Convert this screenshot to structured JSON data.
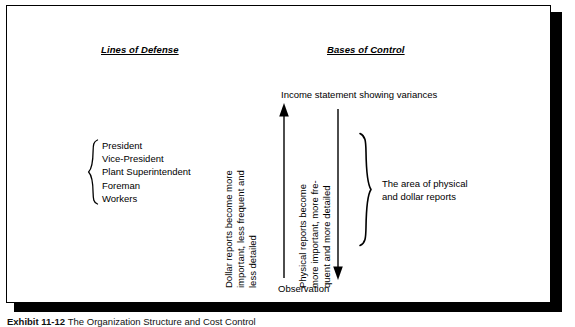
{
  "exhibit": {
    "caption_label": "Exhibit 11-12",
    "caption_title": "The Organization Structure and Cost Control"
  },
  "headings": {
    "left": "Lines of Defense",
    "right": "Bases of Control"
  },
  "hierarchy": {
    "brace": "left-curly-brace",
    "items": [
      "President",
      "Vice-President",
      "Plant Superintendent",
      "Foreman",
      "Workers"
    ]
  },
  "axis": {
    "top_label": "Income statement showing variances",
    "bottom_label": "Observation"
  },
  "arrows": [
    {
      "name": "dollar-reports-arrow",
      "direction": "up",
      "caption_lines": [
        "Dollar reports become more",
        "important, less frequent and",
        "less detailed"
      ]
    },
    {
      "name": "physical-reports-arrow",
      "direction": "down",
      "caption_lines": [
        "Physical reports become",
        "more important, more fre-",
        "quent and more detailed"
      ]
    }
  ],
  "scope": {
    "brace": "right-curly-brace",
    "caption_lines": [
      "The area of physical",
      "and dollar reports"
    ]
  },
  "colors": {
    "ink": "#000000",
    "paper": "#ffffff",
    "shadow": "#000000"
  }
}
